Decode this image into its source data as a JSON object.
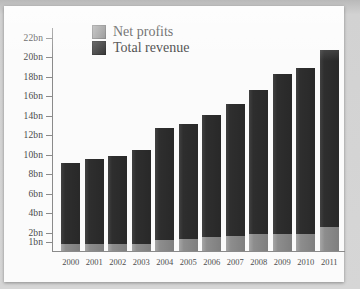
{
  "chart_data": {
    "type": "bar",
    "stacked": true,
    "title": "",
    "xlabel": "",
    "ylabel": "",
    "grid": false,
    "legend_position": "top-center",
    "categories": [
      "2000",
      "2001",
      "2002",
      "2003",
      "2004",
      "2005",
      "2006",
      "2007",
      "2008",
      "2009",
      "2010",
      "2011"
    ],
    "ytick_labels": [
      "1bn",
      "2bn",
      "4bn",
      "6bn",
      "8bn",
      "10bn",
      "12bn",
      "14bn",
      "16bn",
      "18bn",
      "20bn",
      "22bn"
    ],
    "ytick_values": [
      1,
      2,
      4,
      6,
      8,
      10,
      12,
      14,
      16,
      18,
      20,
      22
    ],
    "ylim": [
      0,
      23
    ],
    "series": [
      {
        "name": "Net profits",
        "color": "#8d8d8d",
        "values": [
          0.7,
          0.7,
          0.7,
          0.7,
          1.1,
          1.2,
          1.4,
          1.5,
          1.7,
          1.7,
          1.7,
          2.5
        ]
      },
      {
        "name": "Total revenue",
        "color": "#2e2e2e",
        "values": [
          9.0,
          9.4,
          9.8,
          10.4,
          12.6,
          13.0,
          14.0,
          15.1,
          16.5,
          18.2,
          18.8,
          20.6
        ]
      }
    ]
  },
  "legend": {
    "items": [
      {
        "label": "Net profits",
        "swatch": "net-profits-swatch"
      },
      {
        "label": "Total revenue",
        "swatch": "total-revenue-swatch"
      }
    ]
  }
}
